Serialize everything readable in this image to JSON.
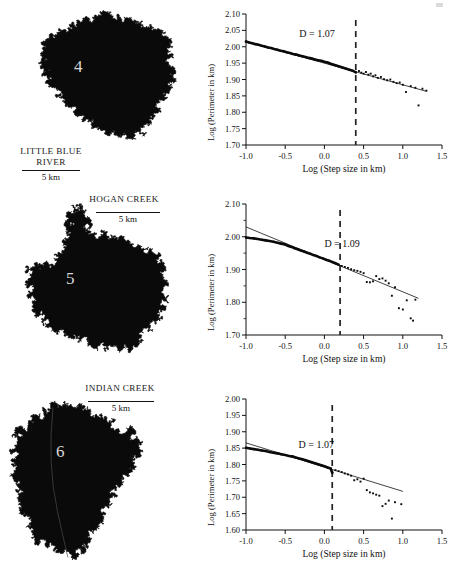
{
  "figure": {
    "panels": [
      {
        "map": {
          "name": "LITTLE BLUE\nRIVER",
          "name_lines": [
            "LITTLE BLUE",
            "RIVER"
          ],
          "number": "4",
          "scale_label": "5 km"
        },
        "chart_data": {
          "type": "scatter",
          "title": "",
          "xlabel": "Log (Step size in km)",
          "ylabel": "Log (Perimeter in km)",
          "xlim": [
            -1.0,
            1.5
          ],
          "ylim": [
            1.7,
            2.1
          ],
          "xticks": [
            -1.0,
            -0.5,
            0.0,
            0.5,
            1.0,
            1.5
          ],
          "xticklabels": [
            "-1.0",
            "-0.5",
            "0.0",
            "0.5",
            "1.0",
            "1.5"
          ],
          "yticks": [
            1.7,
            1.75,
            1.8,
            1.85,
            1.9,
            1.95,
            2.0,
            2.05,
            2.1
          ],
          "yticklabels": [
            "1.70",
            "1.75",
            "1.80",
            "1.85",
            "1.90",
            "1.95",
            "2.00",
            "2.05",
            "2.10"
          ],
          "grid": false,
          "legend": null,
          "annotations": [
            {
              "text": "D = 1.07",
              "x": -0.32,
              "y": 2.035
            }
          ],
          "fractal_dimension": 1.07,
          "breakpoint_x": 0.4,
          "fit_line": {
            "x": [
              -1.0,
              1.3
            ],
            "y": [
              2.016,
              1.864
            ],
            "slope": -0.0661
          },
          "points": [
            {
              "x": -1.0,
              "y": 2.016
            },
            {
              "x": -0.96,
              "y": 2.013
            },
            {
              "x": -0.92,
              "y": 2.011
            },
            {
              "x": -0.88,
              "y": 2.008
            },
            {
              "x": -0.84,
              "y": 2.006
            },
            {
              "x": -0.8,
              "y": 2.003
            },
            {
              "x": -0.76,
              "y": 2.001
            },
            {
              "x": -0.72,
              "y": 1.998
            },
            {
              "x": -0.68,
              "y": 1.996
            },
            {
              "x": -0.64,
              "y": 1.993
            },
            {
              "x": -0.6,
              "y": 1.991
            },
            {
              "x": -0.56,
              "y": 1.988
            },
            {
              "x": -0.52,
              "y": 1.986
            },
            {
              "x": -0.48,
              "y": 1.983
            },
            {
              "x": -0.44,
              "y": 1.981
            },
            {
              "x": -0.4,
              "y": 1.978
            },
            {
              "x": -0.36,
              "y": 1.976
            },
            {
              "x": -0.32,
              "y": 1.973
            },
            {
              "x": -0.28,
              "y": 1.971
            },
            {
              "x": -0.24,
              "y": 1.969
            },
            {
              "x": -0.2,
              "y": 1.966
            },
            {
              "x": -0.16,
              "y": 1.964
            },
            {
              "x": -0.12,
              "y": 1.961
            },
            {
              "x": -0.08,
              "y": 1.959
            },
            {
              "x": -0.04,
              "y": 1.957
            },
            {
              "x": 0.0,
              "y": 1.954
            },
            {
              "x": 0.04,
              "y": 1.952
            },
            {
              "x": 0.08,
              "y": 1.948
            },
            {
              "x": 0.12,
              "y": 1.945
            },
            {
              "x": 0.16,
              "y": 1.942
            },
            {
              "x": 0.2,
              "y": 1.939
            },
            {
              "x": 0.24,
              "y": 1.936
            },
            {
              "x": 0.28,
              "y": 1.933
            },
            {
              "x": 0.32,
              "y": 1.93
            },
            {
              "x": 0.36,
              "y": 1.927
            },
            {
              "x": 0.4,
              "y": 1.922
            },
            {
              "x": 0.44,
              "y": 1.926
            },
            {
              "x": 0.47,
              "y": 1.921
            },
            {
              "x": 0.5,
              "y": 1.918
            },
            {
              "x": 0.53,
              "y": 1.923
            },
            {
              "x": 0.56,
              "y": 1.915
            },
            {
              "x": 0.59,
              "y": 1.918
            },
            {
              "x": 0.62,
              "y": 1.91
            },
            {
              "x": 0.65,
              "y": 1.913
            },
            {
              "x": 0.68,
              "y": 1.905
            },
            {
              "x": 0.72,
              "y": 1.908
            },
            {
              "x": 0.76,
              "y": 1.901
            },
            {
              "x": 0.8,
              "y": 1.898
            },
            {
              "x": 0.84,
              "y": 1.9
            },
            {
              "x": 0.88,
              "y": 1.893
            },
            {
              "x": 0.92,
              "y": 1.889
            },
            {
              "x": 0.96,
              "y": 1.891
            },
            {
              "x": 1.0,
              "y": 1.884
            },
            {
              "x": 1.04,
              "y": 1.862
            },
            {
              "x": 1.1,
              "y": 1.88
            },
            {
              "x": 1.16,
              "y": 1.875
            },
            {
              "x": 1.2,
              "y": 1.821
            },
            {
              "x": 1.25,
              "y": 1.872
            },
            {
              "x": 1.3,
              "y": 1.866
            }
          ]
        }
      },
      {
        "map": {
          "name": "HOGAN CREEK",
          "name_lines": [
            "HOGAN CREEK"
          ],
          "number": "5",
          "scale_label": "5 km"
        },
        "chart_data": {
          "type": "scatter",
          "title": "",
          "xlabel": "Log (Step size in km)",
          "ylabel": "Log (Perimeter in km)",
          "xlim": [
            -1.0,
            1.5
          ],
          "ylim": [
            1.7,
            2.1
          ],
          "xticks": [
            -1.0,
            -0.5,
            0.0,
            0.5,
            1.0,
            1.5
          ],
          "xticklabels": [
            "-1.0",
            "-0.5",
            "0.0",
            "0.5",
            "1.0",
            "1.5"
          ],
          "yticks": [
            1.7,
            1.8,
            1.9,
            2.0,
            2.1
          ],
          "yticklabels": [
            "1.70",
            "1.80",
            "1.90",
            "2.00",
            "2.10"
          ],
          "yminorticks": [
            1.75,
            1.85,
            1.95,
            2.05
          ],
          "grid": false,
          "legend": null,
          "annotations": [
            {
              "text": "D = 1.09",
              "x": 0.0,
              "y": 1.975
            }
          ],
          "fractal_dimension": 1.09,
          "breakpoint_x": 0.2,
          "fit_line": {
            "x": [
              -1.0,
              1.2
            ],
            "y": [
              2.03,
              1.812
            ],
            "slope": -0.0991
          },
          "points": [
            {
              "x": -1.0,
              "y": 1.998
            },
            {
              "x": -0.95,
              "y": 1.996
            },
            {
              "x": -0.9,
              "y": 1.995
            },
            {
              "x": -0.85,
              "y": 1.993
            },
            {
              "x": -0.8,
              "y": 1.991
            },
            {
              "x": -0.75,
              "y": 1.989
            },
            {
              "x": -0.7,
              "y": 1.987
            },
            {
              "x": -0.65,
              "y": 1.985
            },
            {
              "x": -0.6,
              "y": 1.982
            },
            {
              "x": -0.55,
              "y": 1.979
            },
            {
              "x": -0.5,
              "y": 1.976
            },
            {
              "x": -0.46,
              "y": 1.972
            },
            {
              "x": -0.42,
              "y": 1.969
            },
            {
              "x": -0.38,
              "y": 1.965
            },
            {
              "x": -0.34,
              "y": 1.962
            },
            {
              "x": -0.3,
              "y": 1.958
            },
            {
              "x": -0.26,
              "y": 1.955
            },
            {
              "x": -0.22,
              "y": 1.951
            },
            {
              "x": -0.18,
              "y": 1.948
            },
            {
              "x": -0.14,
              "y": 1.944
            },
            {
              "x": -0.1,
              "y": 1.941
            },
            {
              "x": -0.06,
              "y": 1.937
            },
            {
              "x": -0.02,
              "y": 1.934
            },
            {
              "x": 0.02,
              "y": 1.93
            },
            {
              "x": 0.06,
              "y": 1.927
            },
            {
              "x": 0.1,
              "y": 1.923
            },
            {
              "x": 0.14,
              "y": 1.919
            },
            {
              "x": 0.18,
              "y": 1.915
            },
            {
              "x": 0.22,
              "y": 1.911
            },
            {
              "x": 0.26,
              "y": 1.908
            },
            {
              "x": 0.3,
              "y": 1.905
            },
            {
              "x": 0.34,
              "y": 1.901
            },
            {
              "x": 0.38,
              "y": 1.898
            },
            {
              "x": 0.42,
              "y": 1.896
            },
            {
              "x": 0.46,
              "y": 1.893
            },
            {
              "x": 0.5,
              "y": 1.889
            },
            {
              "x": 0.54,
              "y": 1.862
            },
            {
              "x": 0.58,
              "y": 1.861
            },
            {
              "x": 0.62,
              "y": 1.864
            },
            {
              "x": 0.66,
              "y": 1.88
            },
            {
              "x": 0.7,
              "y": 1.871
            },
            {
              "x": 0.74,
              "y": 1.873
            },
            {
              "x": 0.78,
              "y": 1.866
            },
            {
              "x": 0.82,
              "y": 1.858
            },
            {
              "x": 0.86,
              "y": 1.82
            },
            {
              "x": 0.9,
              "y": 1.846
            },
            {
              "x": 0.95,
              "y": 1.782
            },
            {
              "x": 1.0,
              "y": 1.778
            },
            {
              "x": 1.05,
              "y": 1.806
            },
            {
              "x": 1.1,
              "y": 1.751
            },
            {
              "x": 1.13,
              "y": 1.744
            },
            {
              "x": 1.16,
              "y": 1.808
            }
          ]
        }
      },
      {
        "map": {
          "name": "INDIAN CREEK",
          "name_lines": [
            "INDIAN CREEK"
          ],
          "number": "6",
          "scale_label": "5 km"
        },
        "chart_data": {
          "type": "scatter",
          "title": "",
          "xlabel": "Log (Step size in km)",
          "ylabel": "Log (Perimeter in km)",
          "xlim": [
            -1.0,
            1.5
          ],
          "ylim": [
            1.6,
            2.0
          ],
          "xticks": [
            -1.0,
            -0.5,
            0.0,
            0.5,
            1.0,
            1.5
          ],
          "xticklabels": [
            "-1.0",
            "-0.5",
            "0.0",
            "0.5",
            "1.0",
            "1.5"
          ],
          "yticks": [
            1.6,
            1.65,
            1.7,
            1.75,
            1.8,
            1.85,
            1.9,
            1.95,
            2.0
          ],
          "yticklabels": [
            "1.60",
            "1.65",
            "1.70",
            "1.75",
            "1.80",
            "1.85",
            "1.90",
            "1.95",
            "2.00"
          ],
          "grid": false,
          "legend": null,
          "annotations": [
            {
              "text": "D = 1.07",
              "x": -0.33,
              "y": 1.858
            }
          ],
          "fractal_dimension": 1.07,
          "breakpoint_x": 0.1,
          "fit_line": {
            "x": [
              -1.0,
              1.0
            ],
            "y": [
              1.866,
              1.718
            ],
            "slope": -0.074
          },
          "points": [
            {
              "x": -1.0,
              "y": 1.851
            },
            {
              "x": -0.95,
              "y": 1.849
            },
            {
              "x": -0.9,
              "y": 1.847
            },
            {
              "x": -0.85,
              "y": 1.845
            },
            {
              "x": -0.8,
              "y": 1.843
            },
            {
              "x": -0.75,
              "y": 1.841
            },
            {
              "x": -0.7,
              "y": 1.838
            },
            {
              "x": -0.65,
              "y": 1.836
            },
            {
              "x": -0.6,
              "y": 1.834
            },
            {
              "x": -0.55,
              "y": 1.831
            },
            {
              "x": -0.5,
              "y": 1.829
            },
            {
              "x": -0.45,
              "y": 1.826
            },
            {
              "x": -0.4,
              "y": 1.824
            },
            {
              "x": -0.36,
              "y": 1.821
            },
            {
              "x": -0.32,
              "y": 1.818
            },
            {
              "x": -0.28,
              "y": 1.816
            },
            {
              "x": -0.24,
              "y": 1.813
            },
            {
              "x": -0.2,
              "y": 1.81
            },
            {
              "x": -0.16,
              "y": 1.807
            },
            {
              "x": -0.12,
              "y": 1.804
            },
            {
              "x": -0.08,
              "y": 1.801
            },
            {
              "x": -0.04,
              "y": 1.798
            },
            {
              "x": 0.0,
              "y": 1.795
            },
            {
              "x": 0.04,
              "y": 1.791
            },
            {
              "x": 0.08,
              "y": 1.788
            },
            {
              "x": 0.1,
              "y": 1.775
            },
            {
              "x": 0.14,
              "y": 1.783
            },
            {
              "x": 0.18,
              "y": 1.78
            },
            {
              "x": 0.22,
              "y": 1.777
            },
            {
              "x": 0.26,
              "y": 1.773
            },
            {
              "x": 0.3,
              "y": 1.77
            },
            {
              "x": 0.34,
              "y": 1.766
            },
            {
              "x": 0.38,
              "y": 1.752
            },
            {
              "x": 0.42,
              "y": 1.755
            },
            {
              "x": 0.46,
              "y": 1.748
            },
            {
              "x": 0.5,
              "y": 1.757
            },
            {
              "x": 0.54,
              "y": 1.722
            },
            {
              "x": 0.58,
              "y": 1.715
            },
            {
              "x": 0.62,
              "y": 1.712
            },
            {
              "x": 0.66,
              "y": 1.708
            },
            {
              "x": 0.7,
              "y": 1.705
            },
            {
              "x": 0.74,
              "y": 1.673
            },
            {
              "x": 0.78,
              "y": 1.68
            },
            {
              "x": 0.82,
              "y": 1.69
            },
            {
              "x": 0.86,
              "y": 1.635
            },
            {
              "x": 0.9,
              "y": 1.685
            },
            {
              "x": 0.98,
              "y": 1.679
            }
          ]
        }
      }
    ]
  }
}
